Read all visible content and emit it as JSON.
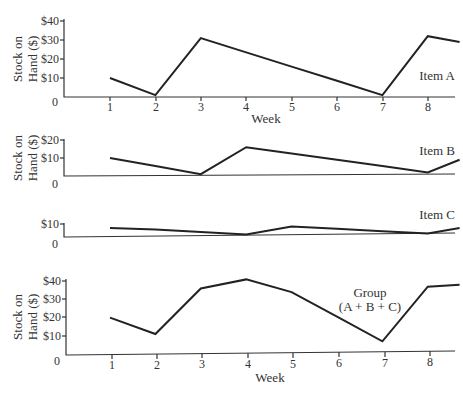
{
  "chart_data": [
    {
      "type": "line",
      "id": "item_a",
      "title": "",
      "series_label": "Item A",
      "xlabel": "Week",
      "ylabel": [
        "Stock on",
        "Hand ($)"
      ],
      "x": [
        1,
        2,
        3,
        4,
        5,
        6,
        7,
        8,
        8.7
      ],
      "values": [
        10,
        1,
        31,
        23.5,
        16,
        8.5,
        1,
        32,
        29
      ],
      "x_ticks": [
        "1",
        "2",
        "3",
        "4",
        "5",
        "6",
        "7",
        "8"
      ],
      "y_ticks": [
        "0",
        "$10",
        "$20",
        "$30",
        "$40"
      ],
      "ylim": [
        0,
        40
      ],
      "grid": false
    },
    {
      "type": "line",
      "id": "item_b",
      "series_label": "Item B",
      "xlabel": "",
      "ylabel": [
        "Stock on",
        "Hand ($)"
      ],
      "x": [
        1,
        2,
        3,
        4,
        5,
        6,
        7,
        8,
        8.7
      ],
      "values": [
        10,
        5.5,
        1,
        16,
        12.5,
        9,
        5.5,
        2,
        9
      ],
      "y_ticks": [
        "0",
        "$10",
        "$20"
      ],
      "ylim": [
        0,
        20
      ],
      "grid": false
    },
    {
      "type": "line",
      "id": "item_c",
      "series_label": "Item C",
      "xlabel": "",
      "ylabel": "",
      "x": [
        1,
        2,
        3,
        4,
        5,
        6,
        7,
        8,
        8.7
      ],
      "values": [
        5,
        4,
        2.5,
        1,
        6,
        4.5,
        3,
        1.5,
        5
      ],
      "y_ticks": [
        "0",
        "$10"
      ],
      "ylim": [
        0,
        10
      ],
      "grid": false
    },
    {
      "type": "line",
      "id": "group",
      "series_label": [
        "Group",
        "(A + B + C)"
      ],
      "xlabel": "Week",
      "ylabel": [
        "Stock on",
        "Hand ($)"
      ],
      "x": [
        1,
        2,
        3,
        4,
        5,
        6,
        7,
        8,
        8.7
      ],
      "values": [
        20,
        11,
        36,
        41,
        34,
        20.5,
        7,
        37,
        38
      ],
      "x_ticks": [
        "1",
        "2",
        "3",
        "4",
        "5",
        "6",
        "7",
        "8"
      ],
      "y_ticks": [
        "0",
        "$10",
        "$20",
        "$30",
        "$40"
      ],
      "ylim": [
        0,
        40
      ],
      "grid": false
    }
  ],
  "panels": {
    "a": {
      "ylabel_line1": "Stock on",
      "ylabel_line2": "Hand ($)",
      "y_ticks": [
        "0",
        "$10",
        "$20",
        "$30",
        "$40"
      ],
      "x_ticks": [
        "1",
        "2",
        "3",
        "4",
        "5",
        "6",
        "7",
        "8"
      ],
      "xlabel": "Week",
      "series_label": "Item A"
    },
    "b": {
      "ylabel_line1": "Stock on",
      "ylabel_line2": "Hand ($)",
      "y_ticks": [
        "0",
        "$10",
        "$20"
      ],
      "series_label": "Item B"
    },
    "c": {
      "y_ticks": [
        "0",
        "$10"
      ],
      "series_label": "Item C"
    },
    "group": {
      "ylabel_line1": "Stock on",
      "ylabel_line2": "Hand ($)",
      "y_ticks": [
        "0",
        "$10",
        "$20",
        "$30",
        "$40"
      ],
      "x_ticks": [
        "1",
        "2",
        "3",
        "4",
        "5",
        "6",
        "7",
        "8"
      ],
      "xlabel": "Week",
      "series_label_line1": "Group",
      "series_label_line2": "(A + B + C)"
    }
  }
}
